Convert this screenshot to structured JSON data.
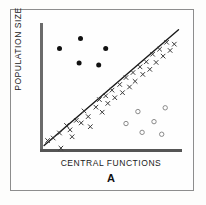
{
  "figure": {
    "panel_label": "A",
    "xlabel": "CENTRAL  FUNCTIONS",
    "ylabel": "POPULATION SIZE",
    "colors": {
      "filled_marker": "#111111",
      "cross_marker": "#3a3a3a",
      "open_marker": "#8a8a8a",
      "trend_line": "#1a1a1a",
      "axis": "#5e5e5e",
      "frame": "#8d8d8d",
      "background": "#fefefe"
    }
  },
  "chart_data": {
    "type": "scatter",
    "title": "",
    "subtitle": "",
    "xlabel": "CENTRAL  FUNCTIONS",
    "ylabel": "POPULATION SIZE",
    "panel": "A",
    "grid": false,
    "legend": "none",
    "axis_ticks": {
      "x": [],
      "y": []
    },
    "xlim": [
      0,
      1
    ],
    "ylim": [
      0,
      1
    ],
    "annotations": [
      {
        "text": "A",
        "role": "panel-label",
        "position": "below-x-axis"
      }
    ],
    "trend_line": {
      "name": "regression line",
      "style": "solid",
      "x": [
        0.015,
        0.975
      ],
      "y": [
        0.035,
        0.955
      ]
    },
    "series": [
      {
        "name": "outlier group (filled circles)",
        "marker": "filled-circle",
        "points": [
          {
            "x": 0.125,
            "y": 0.805
          },
          {
            "x": 0.275,
            "y": 0.885
          },
          {
            "x": 0.455,
            "y": 0.805
          },
          {
            "x": 0.265,
            "y": 0.69
          },
          {
            "x": 0.405,
            "y": 0.675
          }
        ]
      },
      {
        "name": "main group (crosses)",
        "marker": "cross",
        "points": [
          {
            "x": 0.04,
            "y": 0.075
          },
          {
            "x": 0.08,
            "y": 0.095
          },
          {
            "x": 0.125,
            "y": 0.135
          },
          {
            "x": 0.135,
            "y": 0.015
          },
          {
            "x": 0.175,
            "y": 0.195
          },
          {
            "x": 0.2,
            "y": 0.16
          },
          {
            "x": 0.215,
            "y": 0.105
          },
          {
            "x": 0.245,
            "y": 0.235
          },
          {
            "x": 0.28,
            "y": 0.215
          },
          {
            "x": 0.3,
            "y": 0.31
          },
          {
            "x": 0.33,
            "y": 0.265
          },
          {
            "x": 0.345,
            "y": 0.185
          },
          {
            "x": 0.385,
            "y": 0.34
          },
          {
            "x": 0.41,
            "y": 0.4
          },
          {
            "x": 0.43,
            "y": 0.3
          },
          {
            "x": 0.455,
            "y": 0.43
          },
          {
            "x": 0.47,
            "y": 0.37
          },
          {
            "x": 0.5,
            "y": 0.475
          },
          {
            "x": 0.52,
            "y": 0.415
          },
          {
            "x": 0.555,
            "y": 0.52
          },
          {
            "x": 0.575,
            "y": 0.455
          },
          {
            "x": 0.6,
            "y": 0.575
          },
          {
            "x": 0.625,
            "y": 0.5
          },
          {
            "x": 0.65,
            "y": 0.615
          },
          {
            "x": 0.665,
            "y": 0.545
          },
          {
            "x": 0.7,
            "y": 0.66
          },
          {
            "x": 0.72,
            "y": 0.6
          },
          {
            "x": 0.745,
            "y": 0.7
          },
          {
            "x": 0.77,
            "y": 0.64
          },
          {
            "x": 0.79,
            "y": 0.76
          },
          {
            "x": 0.815,
            "y": 0.695
          },
          {
            "x": 0.84,
            "y": 0.8
          },
          {
            "x": 0.865,
            "y": 0.745
          },
          {
            "x": 0.89,
            "y": 0.855
          },
          {
            "x": 0.915,
            "y": 0.79
          },
          {
            "x": 0.945,
            "y": 0.84
          }
        ]
      },
      {
        "name": "low-density group (open circles)",
        "marker": "open-circle",
        "points": [
          {
            "x": 0.6,
            "y": 0.21
          },
          {
            "x": 0.685,
            "y": 0.305
          },
          {
            "x": 0.715,
            "y": 0.14
          },
          {
            "x": 0.8,
            "y": 0.225
          },
          {
            "x": 0.88,
            "y": 0.335
          },
          {
            "x": 0.855,
            "y": 0.125
          }
        ]
      }
    ]
  }
}
